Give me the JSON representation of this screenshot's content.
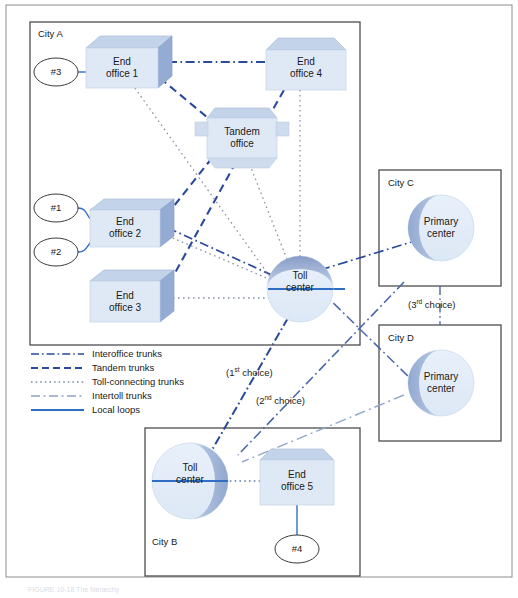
{
  "figure": {
    "caption": "FIGURE 10-18  The hierarchy",
    "outer_frame": true
  },
  "colors": {
    "trunk_blue": "#2a4a9c",
    "local_loop_blue": "#2f6ec4",
    "box_face": "#dce6f4",
    "box_top": "#c3d3e9",
    "box_side": "#9fb4d8",
    "sphere_light": "#e2ecf8",
    "sphere_shade": "#8ea5ce",
    "frame_gray": "#555555",
    "text": "#1a1a1a"
  },
  "cities": [
    {
      "id": "city-a",
      "label": "City A"
    },
    {
      "id": "city-b",
      "label": "City B"
    },
    {
      "id": "city-c",
      "label": "City C"
    },
    {
      "id": "city-d",
      "label": "City D"
    }
  ],
  "nodes": [
    {
      "id": "end-office-1",
      "label": "End\noffice 1",
      "type": "box-3d",
      "city": "City A"
    },
    {
      "id": "end-office-4",
      "label": "End\noffice 4",
      "type": "box-flat",
      "city": "City A"
    },
    {
      "id": "tandem-office",
      "label": "Tandem\noffice",
      "type": "box-flat",
      "city": "City A"
    },
    {
      "id": "end-office-2",
      "label": "End\noffice 2",
      "type": "box-3d",
      "city": "City A"
    },
    {
      "id": "end-office-3",
      "label": "End\noffice 3",
      "type": "box-3d",
      "city": "City A"
    },
    {
      "id": "toll-center-a",
      "label": "Toll\ncenter",
      "type": "sphere",
      "city": "City A"
    },
    {
      "id": "primary-center-c",
      "label": "Primary\ncenter",
      "type": "sphere",
      "city": "City C"
    },
    {
      "id": "primary-center-d",
      "label": "Primary\ncenter",
      "type": "sphere",
      "city": "City D"
    },
    {
      "id": "toll-center-b",
      "label": "Toll\ncenter",
      "type": "sphere",
      "city": "City B"
    },
    {
      "id": "end-office-5",
      "label": "End\noffice 5",
      "type": "box-flat",
      "city": "City B"
    }
  ],
  "subscriber_markers": [
    {
      "id": "marker-3",
      "label": "#3",
      "connects_to": "end-office-1"
    },
    {
      "id": "marker-1",
      "label": "#1",
      "connects_to": "end-office-2"
    },
    {
      "id": "marker-2",
      "label": "#2",
      "connects_to": "end-office-2"
    },
    {
      "id": "marker-4",
      "label": "#4",
      "connects_to": "end-office-5"
    }
  ],
  "legend": {
    "items": [
      {
        "id": "interoffice-trunks",
        "label": "Interoffice trunks",
        "style": "dash-dot",
        "color": "#2a4a9c"
      },
      {
        "id": "tandem-trunks",
        "label": "Tandem trunks",
        "style": "dashed",
        "color": "#2a4a9c"
      },
      {
        "id": "toll-connecting-trunks",
        "label": "Toll-connecting trunks",
        "style": "dotted",
        "color": "#7f8fa6"
      },
      {
        "id": "intertoll-trunks",
        "label": "Intertoll trunks",
        "style": "long-dash-dot",
        "color": "#8fa3c8"
      },
      {
        "id": "local-loops",
        "label": "Local loops",
        "style": "solid",
        "color": "#2f6ec4"
      }
    ]
  },
  "annotations": [
    {
      "id": "choice-1",
      "prefix": "(1",
      "ordinal": "st",
      "suffix": " choice)"
    },
    {
      "id": "choice-2",
      "prefix": "(2",
      "ordinal": "nd",
      "suffix": " choice)"
    },
    {
      "id": "choice-3",
      "prefix": "(3",
      "ordinal": "rd",
      "suffix": " choice)"
    }
  ]
}
